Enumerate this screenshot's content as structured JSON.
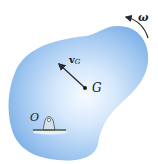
{
  "diagram": {
    "type": "rigid-body-rotation",
    "body": {
      "shape": "blob",
      "fill_center": "#f4f9ff",
      "fill_edge": "#7fb2e8"
    },
    "labels": {
      "angular_velocity": "ω",
      "velocity_symbol": "v",
      "velocity_subscript": "G",
      "center_of_mass": "G",
      "pivot": "O"
    },
    "arrows": [
      {
        "name": "angular-velocity-arrow",
        "direction": "counterclockwise"
      },
      {
        "name": "velocity-vector-vG",
        "from": "G",
        "direction": "up-left"
      }
    ],
    "colors": {
      "arrow": "#2a2a33",
      "ground": "#4a5a3a",
      "support": "#c9d6e0"
    }
  }
}
